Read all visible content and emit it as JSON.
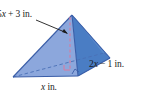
{
  "figure": {
    "type": "geometry-diagram",
    "shape": "rectangular-pyramid",
    "labels": {
      "height": "5x + 3 in.",
      "height_var": "x",
      "height_prefix": "5",
      "height_suffix": " + 3 in.",
      "depth": "2x − 1 in.",
      "depth_prefix": "2",
      "depth_var": "x",
      "depth_suffix": " − 1 in.",
      "width": "x in.",
      "width_var": "x",
      "width_suffix": " in."
    },
    "colors": {
      "face_left": "#8ca7dc",
      "face_right_front": "#4f83c8",
      "face_right_back": "#3f73bd",
      "edge": "#3b5ea8",
      "dashed_base": "#4a6fb5",
      "dashed_height": "#d97a9e",
      "label_text": "#1b1b1b",
      "leader_line": "#1b1b1b",
      "background": "#ffffff"
    },
    "markers": {
      "right_angle_base": "right-angle",
      "right_angle_corner": "right-angle"
    }
  }
}
